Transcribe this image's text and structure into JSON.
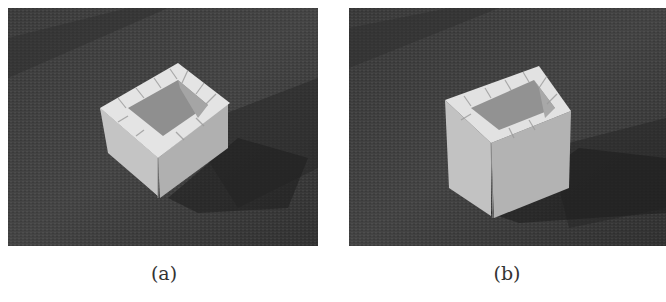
{
  "figure": {
    "panels": [
      {
        "id": "a",
        "caption": "(a)",
        "subject": "impossible box model made of white cardboard pieces on dark textured surface, viewed from above at an angle",
        "background_color": "#3a3a3a",
        "object_color": "#d8d8d8"
      },
      {
        "id": "b",
        "caption": "(b)",
        "subject": "the same impossible box model viewed from a different angle, revealing its taller rectangular shape",
        "background_color": "#3a3a3a",
        "object_color": "#d8d8d8"
      }
    ]
  }
}
